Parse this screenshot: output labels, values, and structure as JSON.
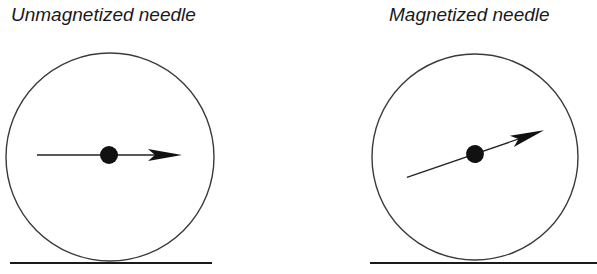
{
  "panels": [
    {
      "id": "unmagnetized",
      "title": "Unmagnetized needle",
      "needle_angle_deg": 0,
      "state": "unmagnetized"
    },
    {
      "id": "magnetized",
      "title": "Magnetized needle",
      "needle_angle_deg": 19,
      "state": "magnetized"
    }
  ],
  "colors": {
    "stroke": "#333333",
    "needle": "#111111",
    "ground": "#1a1a1a"
  }
}
